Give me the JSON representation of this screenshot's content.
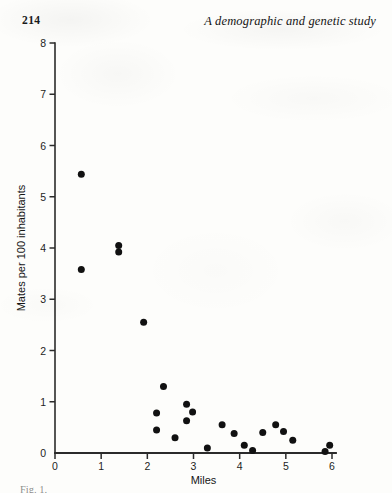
{
  "page": {
    "folio": "214",
    "running_title": "A demographic and genetic study",
    "caption_partial": "Fig. 1."
  },
  "chart_data": {
    "type": "scatter",
    "title": "",
    "xlabel": "Miles",
    "ylabel": "Mates per 100 inhabitants",
    "xlim": [
      0,
      6
    ],
    "ylim": [
      0,
      8
    ],
    "xticks": [
      0,
      1,
      2,
      3,
      4,
      5,
      6
    ],
    "xtick_labels": [
      "0",
      "1",
      "2",
      "3",
      "4",
      "5",
      "6"
    ],
    "yticks": [
      0,
      1,
      2,
      3,
      4,
      5,
      6,
      7,
      8
    ],
    "ytick_labels": [
      "0",
      "1",
      "2",
      "3",
      "4",
      "5",
      "6",
      "7",
      "8"
    ],
    "grid": false,
    "legend": "none",
    "marker": "filled-circle",
    "marker_color": "#111111",
    "marker_size_px": 7,
    "points": [
      {
        "x": 0.57,
        "y": 5.44
      },
      {
        "x": 0.57,
        "y": 3.58
      },
      {
        "x": 1.38,
        "y": 4.05
      },
      {
        "x": 1.38,
        "y": 3.92
      },
      {
        "x": 1.92,
        "y": 2.55
      },
      {
        "x": 2.35,
        "y": 1.3
      },
      {
        "x": 2.2,
        "y": 0.78
      },
      {
        "x": 2.2,
        "y": 0.45
      },
      {
        "x": 2.85,
        "y": 0.95
      },
      {
        "x": 2.98,
        "y": 0.8
      },
      {
        "x": 2.85,
        "y": 0.63
      },
      {
        "x": 2.6,
        "y": 0.3
      },
      {
        "x": 3.3,
        "y": 0.1
      },
      {
        "x": 3.62,
        "y": 0.55
      },
      {
        "x": 3.88,
        "y": 0.38
      },
      {
        "x": 4.1,
        "y": 0.15
      },
      {
        "x": 4.28,
        "y": 0.05
      },
      {
        "x": 4.5,
        "y": 0.4
      },
      {
        "x": 4.78,
        "y": 0.55
      },
      {
        "x": 4.95,
        "y": 0.42
      },
      {
        "x": 5.15,
        "y": 0.25
      },
      {
        "x": 5.85,
        "y": 0.03
      },
      {
        "x": 5.95,
        "y": 0.15
      }
    ]
  }
}
